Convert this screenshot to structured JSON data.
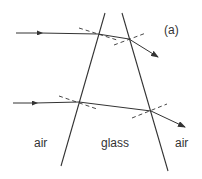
{
  "figure": {
    "panel_label": "(a)",
    "regions": {
      "left": "air",
      "middle": "glass",
      "right": "air"
    },
    "colors": {
      "line": "#333333",
      "background": "#ffffff"
    }
  }
}
